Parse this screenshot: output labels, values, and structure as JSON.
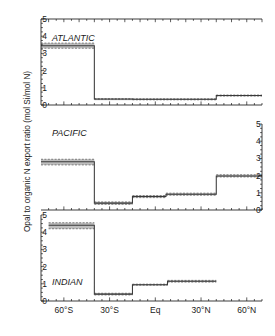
{
  "figure": {
    "ylabel": "Opal to organic N export ratio (mol Si/mol N)",
    "xtick_labels": [
      "60°S",
      "30°S",
      "Eq",
      "30°N",
      "60°N"
    ],
    "xtick_values": [
      -60,
      -30,
      0,
      30,
      60
    ],
    "ytick_labels": [
      "0",
      "1",
      "2",
      "3",
      "4",
      "5"
    ],
    "ytick_values": [
      0,
      1,
      2,
      3,
      4,
      5
    ],
    "band_color": "#b3b3b3",
    "line_color": "#3a3a3a",
    "axis_color": "#1a1a1a"
  },
  "panels": {
    "atlantic": {
      "name": "ATLANTIC"
    },
    "pacific": {
      "name": "PACIFIC"
    },
    "indian": {
      "name": "INDIAN"
    }
  },
  "chart_data": [
    {
      "type": "line",
      "title": "ATLANTIC",
      "xlabel": "",
      "ylabel": "Opal to organic N export ratio (mol Si/mol N)",
      "xlim": [
        -75,
        70
      ],
      "ylim": [
        0,
        5
      ],
      "xticks": [
        -60,
        -30,
        0,
        30,
        60
      ],
      "xticklabels": [
        "60°S",
        "30°S",
        "Eq",
        "30°N",
        "60°N"
      ],
      "yticks": [
        0,
        1,
        2,
        3,
        4,
        5
      ],
      "grid": false,
      "legend": "none",
      "step_segments": [
        {
          "x_start": -75,
          "x_end": -40,
          "value": 3.45,
          "err_low": 3.3,
          "err_high": 3.6
        },
        {
          "x_start": -40,
          "x_end": -15,
          "value": 0.35,
          "err_low": 0.35,
          "err_high": 0.35
        },
        {
          "x_start": -15,
          "x_end": 40,
          "value": 0.33,
          "err_low": 0.3,
          "err_high": 0.36
        },
        {
          "x_start": 40,
          "x_end": 70,
          "value": 0.55,
          "err_low": 0.52,
          "err_high": 0.58
        }
      ]
    },
    {
      "type": "line",
      "title": "PACIFIC",
      "xlabel": "",
      "ylabel": "Opal to organic N export ratio (mol Si/mol N)",
      "xlim": [
        -75,
        70
      ],
      "ylim": [
        0,
        5
      ],
      "yaxis_side": "right",
      "yticks": [
        0,
        1,
        2,
        3,
        4,
        5
      ],
      "grid": false,
      "legend": "none",
      "step_segments": [
        {
          "x_start": -75,
          "x_end": -40,
          "value": 2.8,
          "err_low": 2.62,
          "err_high": 2.95
        },
        {
          "x_start": -40,
          "x_end": -15,
          "value": 0.4,
          "err_low": 0.33,
          "err_high": 0.47
        },
        {
          "x_start": -15,
          "x_end": 7,
          "value": 0.78,
          "err_low": 0.72,
          "err_high": 0.84
        },
        {
          "x_start": 7,
          "x_end": 40,
          "value": 0.92,
          "err_low": 0.86,
          "err_high": 0.98
        },
        {
          "x_start": 40,
          "x_end": 70,
          "value": 1.98,
          "err_low": 1.92,
          "err_high": 2.05
        }
      ]
    },
    {
      "type": "line",
      "title": "INDIAN",
      "xlabel": "",
      "ylabel": "Opal to organic N export ratio (mol Si/mol N)",
      "xlim": [
        -75,
        70
      ],
      "ylim": [
        0,
        5
      ],
      "xticks": [
        -60,
        -30,
        0,
        30,
        60
      ],
      "xticklabels": [
        "60°S",
        "30°S",
        "Eq",
        "30°N",
        "60°N"
      ],
      "yticks": [
        0,
        1,
        2,
        3,
        4,
        5
      ],
      "grid": false,
      "legend": "none",
      "step_segments": [
        {
          "x_start": -70,
          "x_end": -40,
          "value": 4.4,
          "err_low": 4.2,
          "err_high": 4.55
        },
        {
          "x_start": -40,
          "x_end": -15,
          "value": 0.4,
          "err_low": 0.35,
          "err_high": 0.45
        },
        {
          "x_start": -15,
          "x_end": 8,
          "value": 0.95,
          "err_low": 0.92,
          "err_high": 0.98
        },
        {
          "x_start": 8,
          "x_end": 40,
          "value": 1.15,
          "err_low": 1.1,
          "err_high": 1.2
        }
      ]
    }
  ]
}
